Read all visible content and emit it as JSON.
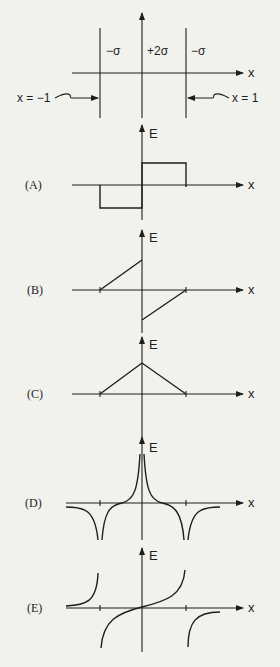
{
  "setup": {
    "charges": [
      {
        "label": "−σ",
        "x": 106,
        "y": 55
      },
      {
        "label": "+2σ",
        "x": 147,
        "y": 55
      },
      {
        "label": "−σ",
        "x": 191,
        "y": 55
      }
    ],
    "x_axis_label": "x",
    "left_plane_label": "x = −1",
    "right_plane_label": "x = 1"
  },
  "graphs": [
    {
      "option": "(A)",
      "e_label": "E",
      "x_label": "x"
    },
    {
      "option": "(B)",
      "e_label": "E",
      "x_label": "x"
    },
    {
      "option": "(C)",
      "e_label": "E",
      "x_label": "x"
    },
    {
      "option": "(D)",
      "e_label": "E",
      "x_label": "x"
    },
    {
      "option": "(E)",
      "e_label": "E",
      "x_label": "x"
    }
  ],
  "colors": {
    "background": "#f1f1ee",
    "ink": "#1e1e1e"
  }
}
